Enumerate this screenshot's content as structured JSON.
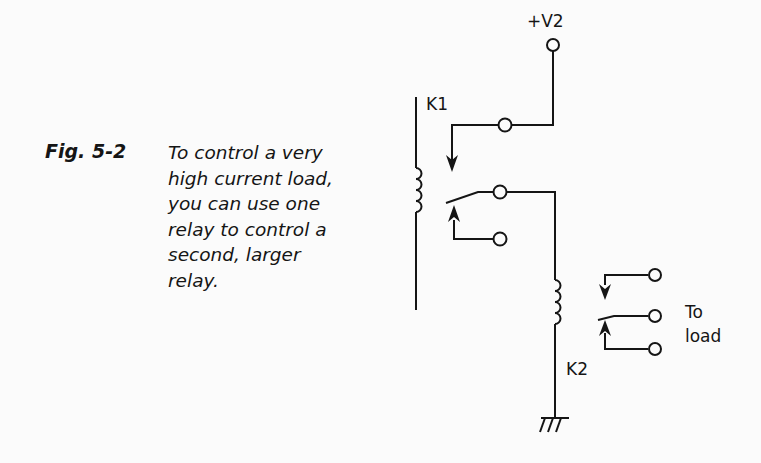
{
  "figure": {
    "label": "Fig. 5-2",
    "caption_lines": [
      "To control a very",
      "high current load,",
      "you can use one",
      "relay to control a",
      "second, larger",
      "relay."
    ]
  },
  "diagram": {
    "supply_label": "+V2",
    "relay1_label": "K1",
    "relay2_label": "K2",
    "load_label_line1": "To",
    "load_label_line2": "load",
    "colors": {
      "line": "#151515",
      "background": "#fbfbfb"
    }
  }
}
